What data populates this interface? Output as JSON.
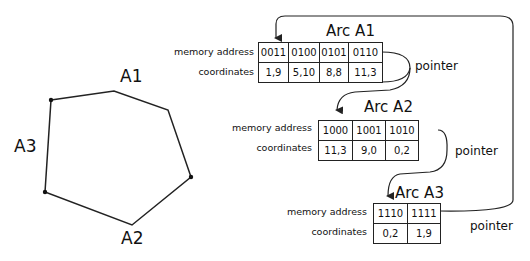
{
  "polygon": {
    "labels": {
      "a1": "A1",
      "a2": "A2",
      "a3": "A3"
    },
    "vertices": [
      [
        51,
        100
      ],
      [
        114,
        91
      ],
      [
        168,
        110
      ],
      [
        191,
        177
      ],
      [
        132,
        225
      ],
      [
        45,
        192
      ]
    ]
  },
  "arcs": [
    {
      "title": "Arc A1",
      "row_labels": {
        "address": "memory address",
        "coords": "coordinates"
      },
      "addresses": [
        "0011",
        "0100",
        "0101",
        "0110"
      ],
      "coordinates": [
        "1,9",
        "5,10",
        "8,8",
        "11,3"
      ],
      "pointer_label": "pointer"
    },
    {
      "title": "Arc A2",
      "row_labels": {
        "address": "memory address",
        "coords": "coordinates"
      },
      "addresses": [
        "1000",
        "1001",
        "1010"
      ],
      "coordinates": [
        "11,3",
        "9,0",
        "0,2"
      ],
      "pointer_label": "pointer"
    },
    {
      "title": "Arc A3",
      "row_labels": {
        "address": "memory address",
        "coords": "coordinates"
      },
      "addresses": [
        "1110",
        "1111"
      ],
      "coordinates": [
        "0,2",
        "1,9"
      ],
      "pointer_label": "pointer"
    }
  ],
  "colors": {
    "stroke": "#222222",
    "background": "#ffffff"
  }
}
